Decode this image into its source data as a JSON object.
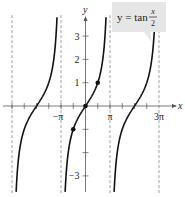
{
  "chart_data": {
    "type": "line",
    "title": "",
    "function_label": {
      "lhs": "y = tan",
      "num": "x",
      "den": "2"
    },
    "xlabel": "x",
    "ylabel": "y",
    "x_ticks": [
      {
        "value": -3.14159,
        "label": "−π"
      },
      {
        "value": 3.14159,
        "label": "π"
      },
      {
        "value": 9.42478,
        "label": "3π"
      }
    ],
    "y_ticks": [
      {
        "value": 3,
        "label": "3"
      },
      {
        "value": 2,
        "label": "2"
      },
      {
        "value": 1,
        "label": "1"
      },
      {
        "value": -3,
        "label": "−3"
      }
    ],
    "asymptotes": [
      -9.42478,
      -3.14159,
      3.14159,
      9.42478
    ],
    "xlim": [
      -10.9,
      12.2
    ],
    "ylim": [
      -3.8,
      3.9
    ],
    "series": [
      {
        "name": "y = tan(x/2)",
        "expression": "tan(x/2)",
        "period": 6.28319
      }
    ],
    "points": [
      {
        "x": -1.5708,
        "y": -1
      },
      {
        "x": 0,
        "y": 0
      },
      {
        "x": 1.5708,
        "y": 1
      }
    ],
    "grid": false,
    "legend": "callout top-right"
  },
  "colors": {
    "curve": "#111111",
    "axis": "#555555",
    "asymptote": "#888888",
    "callout_bg": "#e6e6e6"
  }
}
